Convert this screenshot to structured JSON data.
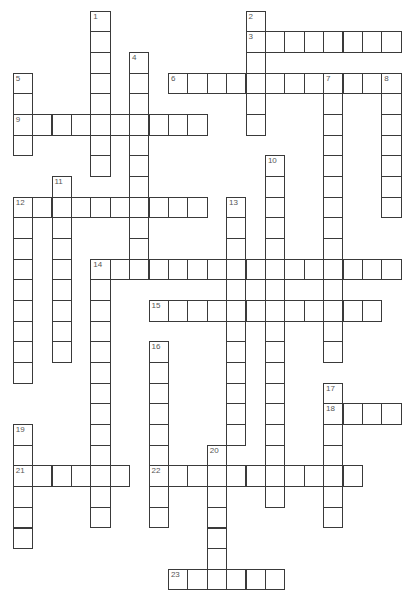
{
  "puzzle": {
    "type": "crossword",
    "grid": {
      "origin_x": 12.7,
      "origin_y": 10.7,
      "cell_width": 19.4,
      "cell_height": 20.67,
      "columns": 20,
      "rows": 28,
      "line_color": "#3a3a3a",
      "number_color": "#555555",
      "background": "#ffffff"
    },
    "entries": [
      {
        "number": "1",
        "direction": "down",
        "col": 4,
        "row": 0,
        "length": 8
      },
      {
        "number": "2",
        "direction": "down",
        "col": 12,
        "row": 0,
        "length": 6
      },
      {
        "number": "3",
        "direction": "across",
        "col": 12,
        "row": 1,
        "length": 8
      },
      {
        "number": "4",
        "direction": "down",
        "col": 6,
        "row": 2,
        "length": 11
      },
      {
        "number": "5",
        "direction": "down",
        "col": 0,
        "row": 3,
        "length": 4
      },
      {
        "number": "6",
        "direction": "across",
        "col": 8,
        "row": 3,
        "length": 12
      },
      {
        "number": "7",
        "direction": "down",
        "col": 16,
        "row": 3,
        "length": 14
      },
      {
        "number": "8",
        "direction": "down",
        "col": 19,
        "row": 3,
        "length": 7
      },
      {
        "number": "9",
        "direction": "across",
        "col": 0,
        "row": 5,
        "length": 10
      },
      {
        "number": "10",
        "direction": "down",
        "col": 13,
        "row": 7,
        "length": 17
      },
      {
        "number": "11",
        "direction": "down",
        "col": 2,
        "row": 8,
        "length": 9
      },
      {
        "number": "12",
        "direction": "across",
        "col": 0,
        "row": 9,
        "length": 10
      },
      {
        "number": "12",
        "direction": "down",
        "col": 0,
        "row": 9,
        "length": 9
      },
      {
        "number": "13",
        "direction": "down",
        "col": 11,
        "row": 9,
        "length": 12
      },
      {
        "number": "14",
        "direction": "across",
        "col": 4,
        "row": 12,
        "length": 16
      },
      {
        "number": "14",
        "direction": "down",
        "col": 4,
        "row": 12,
        "length": 13
      },
      {
        "number": "15",
        "direction": "across",
        "col": 7,
        "row": 14,
        "length": 12
      },
      {
        "number": "16",
        "direction": "down",
        "col": 7,
        "row": 16,
        "length": 9
      },
      {
        "number": "17",
        "direction": "down",
        "col": 16,
        "row": 18,
        "length": 7
      },
      {
        "number": "18",
        "direction": "across",
        "col": 16,
        "row": 19,
        "length": 4
      },
      {
        "number": "19",
        "direction": "down",
        "col": 0,
        "row": 20,
        "length": 6
      },
      {
        "number": "20",
        "direction": "down",
        "col": 10,
        "row": 21,
        "length": 7
      },
      {
        "number": "21",
        "direction": "across",
        "col": 0,
        "row": 22,
        "length": 6
      },
      {
        "number": "22",
        "direction": "across",
        "col": 7,
        "row": 22,
        "length": 11
      },
      {
        "number": "23",
        "direction": "across",
        "col": 8,
        "row": 27,
        "length": 6
      }
    ]
  }
}
